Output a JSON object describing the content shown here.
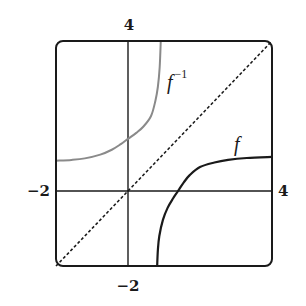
{
  "chart_data": {
    "type": "line",
    "title": "",
    "xlabel": "",
    "ylabel": "",
    "xlim": [
      -2,
      4
    ],
    "ylim": [
      -2,
      4
    ],
    "grid": false,
    "legend": "none",
    "tick_labels": {
      "x_left": "−2",
      "x_right": "4",
      "y_top": "4",
      "y_bottom": "−2"
    },
    "annotations": [
      {
        "text": "f",
        "x": 3.05,
        "y": 1.25
      },
      {
        "text": "f",
        "superscript": "−1",
        "x": 1.1,
        "y": 3.1
      }
    ],
    "series": [
      {
        "name": "f",
        "style": "solid",
        "color": "#1a1a1a",
        "x": [
          0.81,
          0.83,
          0.87,
          0.97,
          1.1,
          1.25,
          1.39,
          1.55,
          1.72,
          2.0,
          2.4,
          2.78,
          3.3,
          4.0
        ],
        "y": [
          -2.0,
          -1.57,
          -1.2,
          -0.77,
          -0.45,
          -0.2,
          0.0,
          0.23,
          0.43,
          0.64,
          0.76,
          0.83,
          0.88,
          0.91
        ]
      },
      {
        "name": "f^-1",
        "style": "solid",
        "color": "#8a8a8a",
        "x": [
          -2.0,
          -1.57,
          -1.2,
          -0.77,
          -0.45,
          -0.2,
          0.0,
          0.23,
          0.43,
          0.64,
          0.76,
          0.83,
          0.88,
          0.91
        ],
        "y": [
          0.81,
          0.83,
          0.87,
          0.97,
          1.1,
          1.25,
          1.39,
          1.55,
          1.72,
          2.0,
          2.4,
          2.78,
          3.3,
          4.0
        ]
      },
      {
        "name": "y = x",
        "style": "dashed",
        "color": "#1a1a1a",
        "x": [
          -2,
          4
        ],
        "y": [
          -2,
          4
        ]
      }
    ]
  },
  "labels": {
    "f": "f",
    "finv_base": "f",
    "finv_sup": "−1",
    "x_left": "−2",
    "x_right": "4",
    "y_top": "4",
    "y_bottom": "−2"
  }
}
